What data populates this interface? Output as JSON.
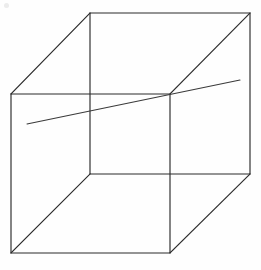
{
  "figure": {
    "type": "line-drawing",
    "width": 261,
    "height": 270,
    "background_color": "#fefefe",
    "stroke_color": "#2b2b2b",
    "line_stroke_color": "#3a3a3a",
    "stroke_width": 1.15
  },
  "geometry": {
    "description": "Wireframe cube drawn in parallel (oblique) projection. Front square is offset down-left from the rear square; the eight vertices are joined by four connecting diagonals. A single straight line passes through the figure from lower-left to upper-right, crossing the upper-right vertex of the front square.",
    "vertices": {
      "front_top_left": {
        "x": 11,
        "y": 94
      },
      "front_top_right": {
        "x": 170,
        "y": 94
      },
      "front_bottom_left": {
        "x": 11,
        "y": 253
      },
      "front_bottom_right": {
        "x": 170,
        "y": 253
      },
      "back_top_left": {
        "x": 90,
        "y": 13
      },
      "back_top_right": {
        "x": 250,
        "y": 13
      },
      "back_bottom_left": {
        "x": 90,
        "y": 174
      },
      "back_bottom_right": {
        "x": 250,
        "y": 174
      }
    },
    "front_square": [
      {
        "x": 11,
        "y": 94
      },
      {
        "x": 170,
        "y": 94
      },
      {
        "x": 170,
        "y": 253
      },
      {
        "x": 11,
        "y": 253
      }
    ],
    "back_square": [
      {
        "x": 90,
        "y": 13
      },
      {
        "x": 250,
        "y": 13
      },
      {
        "x": 250,
        "y": 174
      },
      {
        "x": 90,
        "y": 174
      }
    ],
    "connecting_edges": [
      {
        "from": {
          "x": 11,
          "y": 94
        },
        "to": {
          "x": 90,
          "y": 13
        }
      },
      {
        "from": {
          "x": 170,
          "y": 94
        },
        "to": {
          "x": 250,
          "y": 13
        }
      },
      {
        "from": {
          "x": 11,
          "y": 253
        },
        "to": {
          "x": 90,
          "y": 174
        }
      },
      {
        "from": {
          "x": 170,
          "y": 253
        },
        "to": {
          "x": 250,
          "y": 174
        }
      }
    ],
    "cross_line": {
      "start": {
        "x": 27,
        "y": 124
      },
      "end": {
        "x": 240,
        "y": 80
      },
      "passes_through_vertex": "front_top_right"
    },
    "speck": {
      "x": 4,
      "y": 3,
      "width": 5,
      "height": 5
    }
  },
  "labels": {
    "figure_caption": "",
    "annotations": []
  }
}
